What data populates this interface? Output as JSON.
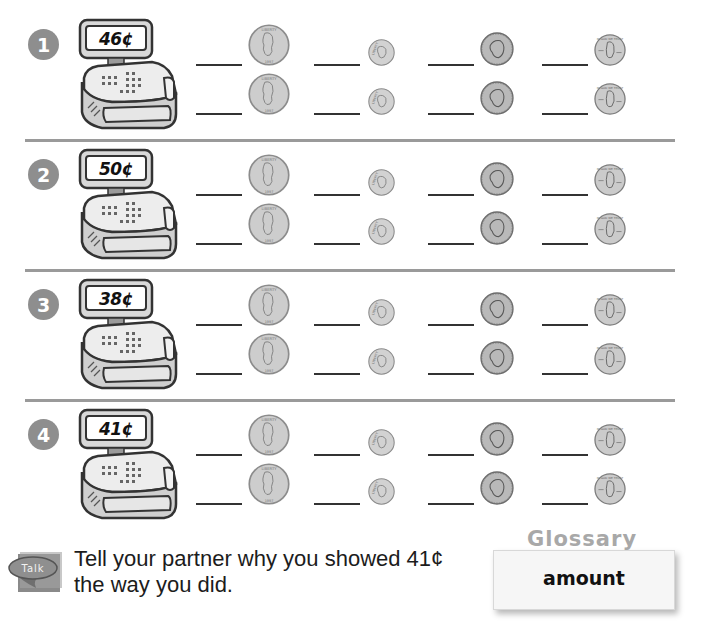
{
  "problems": [
    {
      "number": "1",
      "amount": "46¢"
    },
    {
      "number": "2",
      "amount": "50¢"
    },
    {
      "number": "3",
      "amount": "38¢"
    },
    {
      "number": "4",
      "amount": "41¢"
    }
  ],
  "coin_columns": [
    {
      "coin": "quarter",
      "icon": "quarter-icon"
    },
    {
      "coin": "dime",
      "icon": "dime-icon"
    },
    {
      "coin": "nickel",
      "icon": "nickel-icon"
    },
    {
      "coin": "penny",
      "icon": "penny-icon"
    }
  ],
  "rows_per_problem": 2,
  "talk": {
    "badge_label": "Talk",
    "prompt_line1": "Tell your partner why you showed 41¢",
    "prompt_line2": "the way you did."
  },
  "glossary": {
    "title": "Glossary",
    "word": "amount"
  },
  "colors": {
    "badge": "#8e8e8e",
    "separator": "#9a9a9a",
    "coin_silver": "#cfcfcf",
    "glossary_title": "#a8a8a8"
  }
}
